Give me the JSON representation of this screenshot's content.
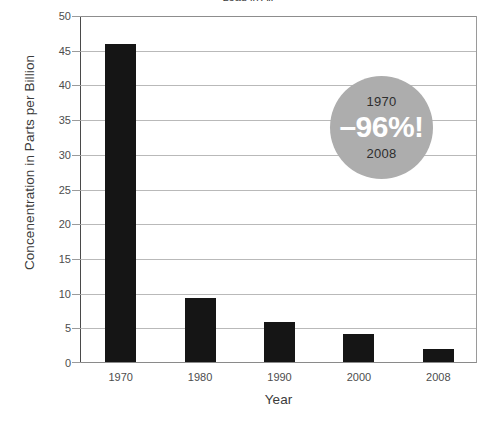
{
  "title_fragment": "Lead in Air",
  "chart_data": {
    "type": "bar",
    "title": "",
    "xlabel": "Year",
    "ylabel": "Concenentration in Parts per Billion",
    "categories": [
      "1970",
      "1980",
      "1990",
      "2000",
      "2008"
    ],
    "values": [
      45.8,
      9.2,
      5.8,
      4.1,
      1.9
    ],
    "ylim": [
      0,
      50
    ],
    "yticks": [
      0,
      5,
      10,
      15,
      20,
      25,
      30,
      35,
      40,
      45,
      50
    ],
    "ytick_labels": [
      "0",
      "5",
      "10",
      "15",
      "20",
      "25",
      "30",
      "35",
      "40",
      "45",
      "50"
    ],
    "grid": true,
    "legend": false,
    "bar_color": "#151515",
    "annotations": [
      {
        "shape": "circle",
        "fill_color": "#adadad",
        "top_label": "1970",
        "main_label": "–96%!",
        "bottom_label": "2008",
        "main_color": "#ffffff",
        "label_color": "#2e2e2e"
      }
    ]
  }
}
